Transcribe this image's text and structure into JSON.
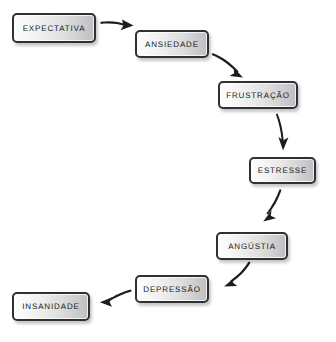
{
  "diagram": {
    "type": "flowchart",
    "direction": "zigzag-descending",
    "colors": {
      "box_border": "#2f3033",
      "box_fill_light": "#fdfdfd",
      "box_fill_dark": "#bfbfc1",
      "arrow": "#1d1d1f",
      "text": "#19191b",
      "background": "#ffffff"
    },
    "nodes": [
      {
        "id": "expectativa",
        "label": "EXPECTATIVA",
        "x": 12,
        "y": 13,
        "w": 84,
        "h": 30
      },
      {
        "id": "ansiedade",
        "label": "ANSIEDADE",
        "x": 135,
        "y": 30,
        "w": 74,
        "h": 28
      },
      {
        "id": "frustracao",
        "label": "FRUSTRAÇÃO",
        "x": 218,
        "y": 81,
        "w": 80,
        "h": 28
      },
      {
        "id": "estresse",
        "label": "ESTRESSE",
        "x": 249,
        "y": 157,
        "w": 67,
        "h": 27
      },
      {
        "id": "angustia",
        "label": "ANGÚSTIA",
        "x": 216,
        "y": 232,
        "w": 72,
        "h": 28
      },
      {
        "id": "depressao",
        "label": "DEPRESSÃO",
        "x": 135,
        "y": 275,
        "w": 74,
        "h": 28
      },
      {
        "id": "insanidade",
        "label": "INSANIDADE",
        "x": 12,
        "y": 292,
        "w": 78,
        "h": 29
      }
    ],
    "edges": [
      {
        "id": "e1",
        "from": "expectativa",
        "to": "ansiedade",
        "direction": "right"
      },
      {
        "id": "e2",
        "from": "ansiedade",
        "to": "frustracao",
        "direction": "down-right"
      },
      {
        "id": "e3",
        "from": "frustracao",
        "to": "estresse",
        "direction": "down"
      },
      {
        "id": "e4",
        "from": "estresse",
        "to": "angustia",
        "direction": "down-left"
      },
      {
        "id": "e5",
        "from": "angustia",
        "to": "depressao",
        "direction": "down-left"
      },
      {
        "id": "e6",
        "from": "depressao",
        "to": "insanidade",
        "direction": "left"
      }
    ]
  }
}
